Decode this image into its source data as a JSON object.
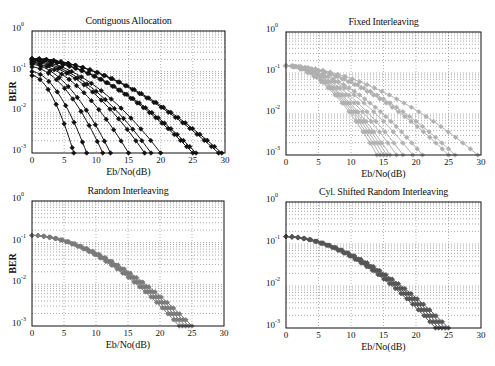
{
  "chart_data": [
    {
      "type": "line",
      "title": "Contiguous Allocation",
      "xlabel": "Eb/No(dB)",
      "ylabel": "BER",
      "yscale": "log",
      "xlim": [
        0,
        30
      ],
      "ylim": [
        0.001,
        1
      ],
      "xticks": [
        "0",
        "5",
        "10",
        "15",
        "20",
        "25",
        "30"
      ],
      "yticks": [
        "10^0",
        "10^-1",
        "10^-2",
        "10^-3"
      ],
      "grid": true,
      "color": "#111111",
      "marker": "diamond",
      "series_end_x": [
        6.5,
        8.5,
        11,
        12.2,
        15,
        17.5,
        18.5,
        20,
        25,
        25.5,
        29,
        29.5
      ],
      "series_start_y": [
        0.08,
        0.1,
        0.13,
        0.15,
        0.16,
        0.17,
        0.18,
        0.19,
        0.2,
        0.2,
        0.21,
        0.21
      ]
    },
    {
      "type": "line",
      "title": "Fixed Interleaving",
      "xlabel": "Eb/No(dB)",
      "ylabel": "",
      "yscale": "log",
      "xlim": [
        0,
        30
      ],
      "ylim": [
        0.001,
        1
      ],
      "xticks": [
        "0",
        "5",
        "10",
        "15",
        "20",
        "25",
        "30"
      ],
      "yticks": [
        "10^0",
        "10^-1",
        "10^-2",
        "10^-3"
      ],
      "grid": true,
      "color": "#b0b0b0",
      "marker": "diamond",
      "series_end_x": [
        14,
        14.5,
        15,
        15.5,
        16,
        17,
        18,
        19.5,
        21,
        25,
        26,
        29.5
      ],
      "series_start_y": [
        0.15,
        0.15,
        0.15,
        0.15,
        0.15,
        0.15,
        0.15,
        0.15,
        0.15,
        0.15,
        0.15,
        0.15
      ]
    },
    {
      "type": "line",
      "title": "Random Interleaving",
      "xlabel": "Eb/No(dB)",
      "ylabel": "BER",
      "yscale": "log",
      "xlim": [
        0,
        30
      ],
      "ylim": [
        0.001,
        1
      ],
      "xticks": [
        "0",
        "5",
        "10",
        "15",
        "20",
        "25",
        "30"
      ],
      "yticks": [
        "10^0",
        "10^-1",
        "10^-2",
        "10^-3"
      ],
      "grid": true,
      "color": "#7a7a7a",
      "marker": "diamond",
      "series_end_x": [
        23,
        23.5,
        24,
        24.5,
        25
      ],
      "series_start_y": [
        0.15,
        0.15,
        0.15,
        0.15,
        0.15
      ]
    },
    {
      "type": "line",
      "title": "Cyl. Shifted Random Interleaving",
      "xlabel": "Eb/No(dB)",
      "ylabel": "",
      "yscale": "log",
      "xlim": [
        0,
        30
      ],
      "ylim": [
        0.001,
        1
      ],
      "xticks": [
        "0",
        "5",
        "10",
        "15",
        "20",
        "25",
        "30"
      ],
      "yticks": [
        "10^0",
        "10^-1",
        "10^-2",
        "10^-3"
      ],
      "grid": true,
      "color": "#555555",
      "marker": "diamond",
      "series_end_x": [
        23,
        23.5,
        24,
        24.5,
        25
      ],
      "series_start_y": [
        0.15,
        0.15,
        0.15,
        0.15,
        0.15
      ]
    }
  ],
  "panels": [
    {
      "title": "Contiguous Allocation",
      "xlabel": "Eb/No(dB)",
      "ylabel": "BER",
      "box": [
        32,
        31,
        193,
        122
      ]
    },
    {
      "title": "Fixed Interleaving",
      "xlabel": "Eb/No(dB)",
      "ylabel": "",
      "box": [
        286,
        32,
        195,
        123
      ]
    },
    {
      "title": "Random Interleaving",
      "xlabel": "Eb/No(dB)",
      "ylabel": "BER",
      "box": [
        32,
        201,
        192,
        125
      ]
    },
    {
      "title": "Cyl. Shifted Random Interleaving",
      "xlabel": "Eb/No(dB)",
      "ylabel": "",
      "box": [
        286,
        202,
        195,
        126
      ]
    }
  ],
  "axis": {
    "xticks": [
      "0",
      "5",
      "10",
      "15",
      "20",
      "25",
      "30"
    ],
    "ytick_base": "10",
    "ytick_exps": [
      "0",
      "-1",
      "-2",
      "-3"
    ]
  }
}
